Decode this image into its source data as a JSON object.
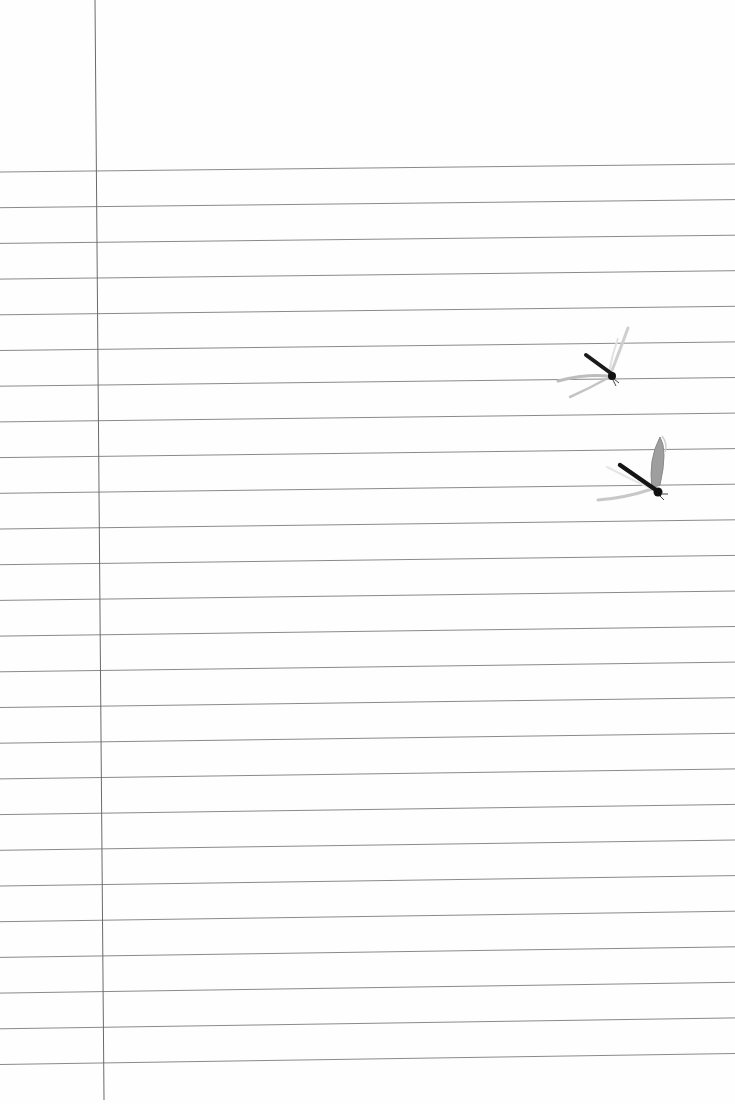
{
  "scene": {
    "description": "Lined notebook paper with a vertical margin line and two dragonflies",
    "background_color": "#fefefe",
    "rule_line_color": "#8a8a8a",
    "margin_line_color": "#6a6a6a",
    "rule_lines": {
      "count": 26,
      "first_left_y": 172,
      "first_right_y": 164,
      "spacing": 35.7
    },
    "margin_line": {
      "top_x": 95,
      "bottom_x": 104,
      "bottom_y": 1100
    }
  },
  "objects": [
    {
      "name": "dragonfly-upper",
      "position": [
        600,
        362
      ]
    },
    {
      "name": "dragonfly-lower",
      "position": [
        638,
        470
      ]
    }
  ]
}
